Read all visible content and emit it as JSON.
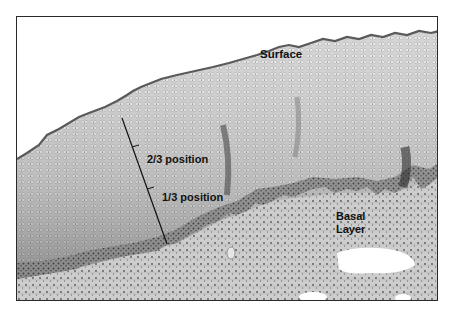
{
  "figure": {
    "type": "histology micrograph (grayscale, stratified squamous epithelium)",
    "labels": {
      "surface": "Surface",
      "two_thirds": "2/3 position",
      "one_third": "1/3 position",
      "basal_line1": "Basal",
      "basal_line2": "Layer"
    },
    "colors": {
      "frame": "#2a2a2a",
      "surface_line": "#5a5a5a",
      "epithelium_light": "#d4d4d4",
      "epithelium_mid": "#a9a9a9",
      "basal_dark": "#6e6e6e",
      "stroma": "#c8c8c8",
      "measure_line": "#111111"
    }
  }
}
